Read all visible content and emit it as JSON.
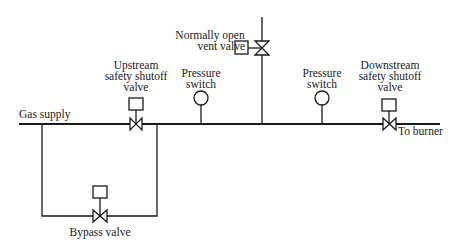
{
  "diagram": {
    "colors": {
      "line": "#1a1a1a",
      "background": "#ffffff"
    },
    "labels": {
      "gas_supply": "Gas supply",
      "to_burner": "To burner",
      "upstream_valve": [
        "Upstream",
        "safety shutoff",
        "valve"
      ],
      "vent_valve": [
        "Normally open",
        "vent valve"
      ],
      "pressure_switch_1": [
        "Pressure",
        "switch"
      ],
      "pressure_switch_2": [
        "Pressure",
        "switch"
      ],
      "downstream_valve": [
        "Downstream",
        "safety shutoff",
        "valve"
      ],
      "bypass_valve": "Bypass valve"
    },
    "components": [
      {
        "id": "upstream-safety-shutoff-valve",
        "type": "valve-with-actuator"
      },
      {
        "id": "pressure-switch-1",
        "type": "pressure-switch"
      },
      {
        "id": "normally-open-vent-valve",
        "type": "valve-with-actuator",
        "orientation": "vertical"
      },
      {
        "id": "pressure-switch-2",
        "type": "pressure-switch"
      },
      {
        "id": "downstream-safety-shutoff-valve",
        "type": "valve-with-actuator"
      },
      {
        "id": "bypass-valve",
        "type": "valve-with-actuator"
      }
    ]
  }
}
